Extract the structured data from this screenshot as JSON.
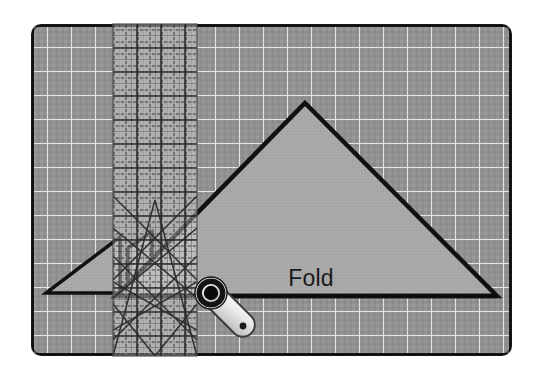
{
  "scene": {
    "title": "Quilting cutting mat with ruler, folded fabric triangle and rotary cutter",
    "width": 535,
    "height": 377,
    "background_color": "#ffffff"
  },
  "cutting_mat": {
    "name": "self-healing cutting mat",
    "surface_color": "#8e8e8e",
    "border_color": "#1c1c1c",
    "grid_line_color": "#e2e2e2",
    "minor_grid_color": "#b4b4b4",
    "bounds": {
      "x": 31,
      "y": 24,
      "width": 481,
      "height": 332
    },
    "corner_radius": 10,
    "major_grid_spacing": 24,
    "minor_grid_spacing": 6
  },
  "ruler": {
    "name": "acrylic quilting ruler",
    "fill_color": "#c8c8c8",
    "line_color": "#3a3a3a",
    "bounds": {
      "x": 113,
      "y": 24,
      "width": 84,
      "height": 332
    },
    "grid_spacing": 12,
    "tick_spacing": 6,
    "angle_guides": [
      45,
      60,
      30
    ],
    "opacity": 0.45
  },
  "fabric": {
    "name": "folded fabric triangle",
    "fill_color": "#a8a8a8",
    "edge_color": "#111111",
    "edge_width": 4,
    "apex": {
      "x": 305,
      "y": 103
    },
    "left_point": {
      "x": 116,
      "y": 296
    },
    "right_point": {
      "x": 497,
      "y": 296
    },
    "fold_label": "Fold",
    "fold_label_position": {
      "x": 311,
      "y": 286
    }
  },
  "small_triangles": {
    "name": "fabric scrap triangles",
    "fill_color": "#9a9a9a",
    "edge_color": "#111111",
    "items": [
      {
        "label": "scrap-triangle-large",
        "points": "46,293 120,293 120,237"
      },
      {
        "label": "scrap-triangle-small",
        "points": "128,293 128,248 152,232 152,293"
      }
    ]
  },
  "rotary_cutter": {
    "name": "rotary cutter",
    "blade_center": {
      "x": 211,
      "y": 293
    },
    "blade_outer_radius": 15,
    "blade_inner_radius": 8.5,
    "blade_ring_color": "#141414",
    "blade_hub_color": "#0a0a0a",
    "blade_rim_color": "#f2f2f2",
    "handle_color": "#e8e8e8",
    "handle_edge_color": "#3d3d3d",
    "handle_tip": {
      "x": 249,
      "y": 332
    },
    "screw_dot": {
      "x": 243,
      "y": 326
    },
    "screw_color": "#1a1a1a",
    "guard_color": "#555555"
  }
}
